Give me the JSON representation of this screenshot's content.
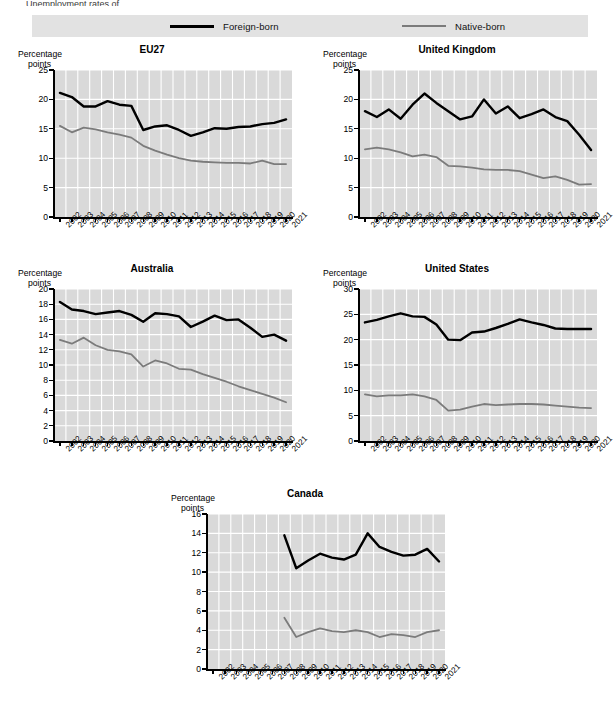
{
  "page": {
    "cutoff_text_top": "Unemployment rates of",
    "background_color": "#ffffff",
    "plot_background_color": "#d9d9d9",
    "gridline_color": "#ffffff"
  },
  "legend": {
    "items": [
      {
        "label": "Foreign-born",
        "color": "#000000",
        "style": "solid-thick"
      },
      {
        "label": "Native-born",
        "color": "#7b7b7b",
        "style": "solid-medium"
      }
    ]
  },
  "axis_caption": {
    "line1": "Percentage",
    "line2": "points"
  },
  "chart_data": [
    {
      "type": "line",
      "title": "EU27",
      "xlabel": "",
      "ylabel": "Percentage points",
      "ylim": [
        0,
        25
      ],
      "yticks": [
        0,
        5,
        10,
        15,
        20,
        25
      ],
      "grid": true,
      "legend_position": "top-shared",
      "x": [
        2002,
        2003,
        2004,
        2005,
        2006,
        2007,
        2008,
        2009,
        2010,
        2011,
        2012,
        2013,
        2014,
        2015,
        2016,
        2017,
        2018,
        2019,
        2020,
        2021
      ],
      "series": [
        {
          "name": "Foreign-born",
          "color": "#000000",
          "values": [
            21.1,
            20.4,
            18.8,
            18.8,
            19.7,
            19.1,
            18.9,
            14.8,
            15.4,
            15.6,
            14.8,
            13.8,
            14.4,
            15.1,
            15.0,
            15.3,
            15.4,
            15.8,
            16.0,
            16.6
          ]
        },
        {
          "name": "Native-born",
          "color": "#7b7b7b",
          "values": [
            15.5,
            14.4,
            15.2,
            14.9,
            14.4,
            14.0,
            13.5,
            12.1,
            11.3,
            10.6,
            10.0,
            9.6,
            9.4,
            9.3,
            9.2,
            9.2,
            9.1,
            9.6,
            9.0,
            9.0
          ]
        }
      ]
    },
    {
      "type": "line",
      "title": "United Kingdom",
      "xlabel": "",
      "ylabel": "Percentage points",
      "ylim": [
        0,
        25
      ],
      "yticks": [
        0,
        5,
        10,
        15,
        20,
        25
      ],
      "grid": true,
      "legend_position": "top-shared",
      "x": [
        2002,
        2003,
        2004,
        2005,
        2006,
        2007,
        2008,
        2009,
        2010,
        2011,
        2012,
        2013,
        2014,
        2015,
        2016,
        2017,
        2018,
        2019,
        2020,
        2021
      ],
      "series": [
        {
          "name": "Foreign-born",
          "color": "#000000",
          "values": [
            18.0,
            17.0,
            18.3,
            16.7,
            19.1,
            21.0,
            19.4,
            18.0,
            16.6,
            17.1,
            20.0,
            17.6,
            18.8,
            16.8,
            17.5,
            18.3,
            17.0,
            16.3,
            14.0,
            11.4
          ]
        },
        {
          "name": "Native-born",
          "color": "#7b7b7b",
          "values": [
            11.5,
            11.8,
            11.5,
            11.0,
            10.3,
            10.6,
            10.2,
            8.7,
            8.6,
            8.4,
            8.1,
            8.0,
            8.0,
            7.8,
            7.2,
            6.6,
            6.9,
            6.3,
            5.5,
            5.6
          ]
        }
      ]
    },
    {
      "type": "line",
      "title": "Australia",
      "xlabel": "",
      "ylabel": "Percentage points",
      "ylim": [
        0,
        20
      ],
      "yticks": [
        0,
        2,
        4,
        6,
        8,
        10,
        12,
        14,
        16,
        18,
        20
      ],
      "grid": true,
      "legend_position": "top-shared",
      "x": [
        2002,
        2003,
        2004,
        2005,
        2006,
        2007,
        2008,
        2009,
        2010,
        2011,
        2012,
        2013,
        2014,
        2015,
        2016,
        2017,
        2018,
        2019,
        2020,
        2021
      ],
      "series": [
        {
          "name": "Foreign-born",
          "color": "#000000",
          "values": [
            18.3,
            17.3,
            17.1,
            16.7,
            16.9,
            17.1,
            16.6,
            15.7,
            16.8,
            16.7,
            16.4,
            15.0,
            15.7,
            16.5,
            15.9,
            16.0,
            14.9,
            13.7,
            14.0,
            13.2
          ]
        },
        {
          "name": "Native-born",
          "color": "#7b7b7b",
          "values": [
            13.3,
            12.8,
            13.6,
            12.6,
            12.0,
            11.8,
            11.4,
            9.8,
            10.6,
            10.2,
            9.5,
            9.4,
            8.8,
            8.3,
            7.8,
            7.2,
            6.7,
            6.2,
            5.7,
            5.1
          ]
        }
      ]
    },
    {
      "type": "line",
      "title": "United States",
      "xlabel": "",
      "ylabel": "Percentage points",
      "ylim": [
        0,
        30
      ],
      "yticks": [
        0,
        5,
        10,
        15,
        20,
        25,
        30
      ],
      "grid": true,
      "legend_position": "top-shared",
      "x": [
        2002,
        2003,
        2004,
        2005,
        2006,
        2007,
        2008,
        2009,
        2010,
        2011,
        2012,
        2013,
        2014,
        2015,
        2016,
        2017,
        2018,
        2019,
        2020,
        2021
      ],
      "series": [
        {
          "name": "Foreign-born",
          "color": "#000000",
          "values": [
            23.4,
            23.9,
            24.6,
            25.2,
            24.6,
            24.5,
            23.0,
            20.0,
            19.9,
            21.4,
            21.6,
            22.3,
            23.1,
            24.0,
            23.4,
            22.9,
            22.2,
            22.1,
            22.1,
            22.1
          ]
        },
        {
          "name": "Native-born",
          "color": "#7b7b7b",
          "values": [
            9.2,
            8.8,
            9.0,
            9.0,
            9.2,
            8.8,
            8.1,
            6.0,
            6.2,
            6.8,
            7.3,
            7.1,
            7.2,
            7.3,
            7.3,
            7.2,
            7.0,
            6.8,
            6.6,
            6.5
          ]
        }
      ]
    },
    {
      "type": "line",
      "title": "Canada",
      "xlabel": "",
      "ylabel": "Percentage points",
      "ylim": [
        0,
        16
      ],
      "yticks": [
        0,
        2,
        4,
        6,
        8,
        10,
        12,
        14,
        16
      ],
      "grid": true,
      "legend_position": "top-shared",
      "x": [
        2002,
        2003,
        2004,
        2005,
        2006,
        2007,
        2008,
        2009,
        2010,
        2011,
        2012,
        2013,
        2014,
        2015,
        2016,
        2017,
        2018,
        2019,
        2020,
        2021
      ],
      "series": [
        {
          "name": "Foreign-born",
          "color": "#000000",
          "values": [
            null,
            null,
            null,
            null,
            null,
            null,
            13.8,
            10.4,
            11.2,
            11.9,
            11.5,
            11.3,
            11.8,
            14.0,
            12.6,
            12.1,
            11.7,
            11.8,
            12.4,
            11.1
          ]
        },
        {
          "name": "Native-born",
          "color": "#7b7b7b",
          "values": [
            null,
            null,
            null,
            null,
            null,
            null,
            5.3,
            3.3,
            3.8,
            4.2,
            3.9,
            3.8,
            4.0,
            3.8,
            3.3,
            3.6,
            3.5,
            3.3,
            3.8,
            4.0
          ]
        }
      ]
    }
  ]
}
